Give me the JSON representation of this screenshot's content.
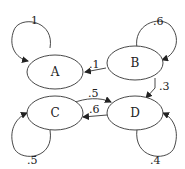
{
  "diagram": {
    "type": "markov-chain",
    "nodes": [
      {
        "id": "A",
        "label": "A"
      },
      {
        "id": "B",
        "label": "B"
      },
      {
        "id": "C",
        "label": "C"
      },
      {
        "id": "D",
        "label": "D"
      }
    ],
    "edges": [
      {
        "from": "A",
        "to": "A",
        "label": "1"
      },
      {
        "from": "B",
        "to": "B",
        "label": ".6"
      },
      {
        "from": "B",
        "to": "A",
        "label": ".1"
      },
      {
        "from": "B",
        "to": "D",
        "label": ".3"
      },
      {
        "from": "C",
        "to": "D",
        "label": ".5"
      },
      {
        "from": "D",
        "to": "C",
        "label": ".6"
      },
      {
        "from": "C",
        "to": "C",
        "label": ".5"
      },
      {
        "from": "D",
        "to": "D",
        "label": ".4"
      }
    ]
  }
}
